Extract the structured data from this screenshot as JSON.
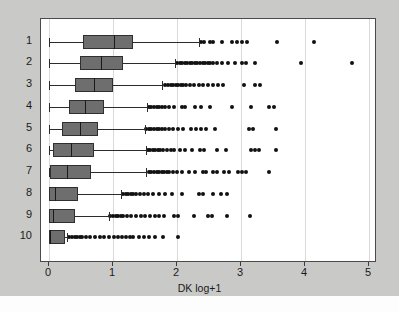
{
  "chart_data": {
    "type": "box",
    "title": "",
    "xlabel": "DK log+1",
    "ylabel": "",
    "orientation": "horizontal",
    "xlim": [
      -0.06,
      5.2
    ],
    "xticks": [
      0,
      1,
      2,
      3,
      4,
      5
    ],
    "xticklabels": [
      "0",
      "1",
      "2",
      "3",
      "4",
      "5"
    ],
    "grid": "vertical",
    "categories": [
      "1",
      "2",
      "3",
      "4",
      "5",
      "6",
      "7",
      "8",
      "9",
      "10"
    ],
    "colors": {
      "box_fill": "#6e6e6e",
      "box_edge": "#2f2f2f",
      "median": "#1a1a1a",
      "whisker": "#2b2b2b",
      "outlier": "#111111",
      "plot_background": "#ffffff",
      "figure_background": "#c9c9c7",
      "grid": "#d9d9d9",
      "frame": "#4a4a4a"
    },
    "boxes": [
      {
        "category": "1",
        "whisker_low": 0.0,
        "q1": 0.53,
        "median": 1.02,
        "q3": 1.31,
        "whisker_high": 2.35,
        "outliers": [
          2.38,
          2.42,
          2.52,
          2.56,
          2.7,
          2.86,
          2.94,
          3.02,
          3.1,
          3.56,
          4.14
        ]
      },
      {
        "category": "2",
        "whisker_low": 0.0,
        "q1": 0.49,
        "median": 0.81,
        "q3": 1.15,
        "whisker_high": 1.97,
        "outliers": [
          2.0,
          2.04,
          2.08,
          2.12,
          2.16,
          2.2,
          2.24,
          2.28,
          2.32,
          2.36,
          2.4,
          2.44,
          2.48,
          2.52,
          2.56,
          2.62,
          2.7,
          2.8,
          2.9,
          3.02,
          3.08,
          3.22,
          3.94,
          4.74
        ]
      },
      {
        "category": "3",
        "whisker_low": 0.0,
        "q1": 0.4,
        "median": 0.7,
        "q3": 1.0,
        "whisker_high": 1.77,
        "outliers": [
          1.82,
          1.86,
          1.9,
          1.94,
          1.98,
          2.02,
          2.06,
          2.1,
          2.14,
          2.2,
          2.26,
          2.34,
          2.4,
          2.48,
          2.56,
          2.64,
          2.72,
          3.04,
          3.22,
          3.3
        ]
      },
      {
        "category": "4",
        "whisker_low": 0.0,
        "q1": 0.31,
        "median": 0.57,
        "q3": 0.86,
        "whisker_high": 1.53,
        "outliers": [
          1.56,
          1.6,
          1.64,
          1.68,
          1.72,
          1.76,
          1.82,
          1.88,
          1.96,
          2.08,
          2.12,
          2.28,
          2.38,
          2.52,
          2.86,
          3.16,
          3.44,
          3.52
        ]
      },
      {
        "category": "5",
        "whisker_low": 0.0,
        "q1": 0.2,
        "median": 0.49,
        "q3": 0.76,
        "whisker_high": 1.5,
        "outliers": [
          1.52,
          1.56,
          1.6,
          1.64,
          1.68,
          1.72,
          1.76,
          1.82,
          1.88,
          1.94,
          2.02,
          2.1,
          2.22,
          2.3,
          2.38,
          2.46,
          2.6,
          3.12,
          3.18,
          3.54
        ]
      },
      {
        "category": "6",
        "whisker_low": 0.0,
        "q1": 0.07,
        "median": 0.35,
        "q3": 0.71,
        "whisker_high": 1.52,
        "outliers": [
          1.54,
          1.58,
          1.62,
          1.66,
          1.7,
          1.74,
          1.78,
          1.84,
          1.9,
          1.96,
          2.04,
          2.12,
          2.24,
          2.36,
          2.42,
          2.62,
          2.76,
          3.16,
          3.22,
          3.28,
          3.54
        ]
      },
      {
        "category": "7",
        "whisker_low": 0.0,
        "q1": 0.02,
        "median": 0.28,
        "q3": 0.65,
        "whisker_high": 1.52,
        "outliers": [
          1.56,
          1.6,
          1.64,
          1.68,
          1.72,
          1.76,
          1.8,
          1.84,
          1.88,
          1.94,
          2.0,
          2.08,
          2.18,
          2.28,
          2.4,
          2.46,
          2.56,
          2.62,
          2.74,
          2.82,
          2.96,
          3.02,
          3.08,
          3.44
        ]
      },
      {
        "category": "8",
        "whisker_low": 0.0,
        "q1": 0.0,
        "median": 0.09,
        "q3": 0.46,
        "whisker_high": 1.13,
        "outliers": [
          1.16,
          1.2,
          1.24,
          1.28,
          1.32,
          1.36,
          1.42,
          1.48,
          1.54,
          1.62,
          1.72,
          1.82,
          1.92,
          2.08,
          2.34,
          2.4,
          2.56,
          2.68,
          2.78
        ]
      },
      {
        "category": "9",
        "whisker_low": 0.0,
        "q1": 0.0,
        "median": 0.06,
        "q3": 0.41,
        "whisker_high": 0.93,
        "outliers": [
          0.96,
          1.0,
          1.04,
          1.08,
          1.12,
          1.16,
          1.22,
          1.28,
          1.36,
          1.44,
          1.5,
          1.58,
          1.66,
          1.72,
          1.8,
          1.96,
          2.02,
          2.26,
          2.48,
          2.54,
          2.78,
          3.14
        ]
      },
      {
        "category": "10",
        "whisker_low": 0.0,
        "q1": 0.0,
        "median": 0.01,
        "q3": 0.25,
        "whisker_high": 0.28,
        "outliers": [
          0.32,
          0.36,
          0.4,
          0.44,
          0.48,
          0.52,
          0.58,
          0.64,
          0.72,
          0.8,
          0.86,
          0.94,
          1.02,
          1.08,
          1.14,
          1.2,
          1.26,
          1.32,
          1.4,
          1.48,
          1.56,
          1.66,
          1.78,
          2.02
        ]
      }
    ]
  }
}
